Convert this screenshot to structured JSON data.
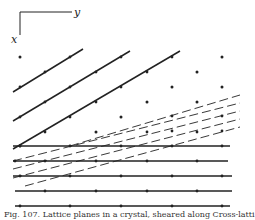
{
  "figure": {
    "axes": {
      "x_label": "x",
      "y_label": "y",
      "corner": [
        20,
        12
      ],
      "y_axis_end": [
        72,
        12
      ],
      "x_axis_end": [
        20,
        35
      ]
    },
    "colors": {
      "ink": "#222222",
      "background": "#ffffff"
    },
    "solid_diagonal_lines": [
      {
        "from": [
          13,
          92
        ],
        "to": [
          83,
          49
        ],
        "dots": [
          [
            20,
            87
          ],
          [
            45,
            72
          ],
          [
            70,
            57
          ]
        ]
      },
      {
        "from": [
          13,
          121
        ],
        "to": [
          130,
          51
        ],
        "dots": [
          [
            20,
            117
          ],
          [
            45,
            102
          ],
          [
            70,
            87
          ],
          [
            96,
            72
          ],
          [
            121,
            57
          ]
        ]
      },
      {
        "from": [
          13,
          149
        ],
        "to": [
          180,
          51
        ],
        "dots": [
          [
            20,
            146
          ],
          [
            45,
            132
          ],
          [
            70,
            117
          ],
          [
            96,
            102
          ],
          [
            121,
            87
          ],
          [
            147,
            72
          ],
          [
            172,
            57
          ]
        ]
      }
    ],
    "horizontal_lines": [
      {
        "y": 146,
        "from_x": 13,
        "to_x": 230,
        "dots": [
          20,
          70,
          121,
          172,
          222
        ]
      },
      {
        "y": 161,
        "from_x": 13,
        "to_x": 228,
        "dots": [
          15,
          45,
          96,
          147,
          197
        ]
      },
      {
        "y": 176,
        "from_x": 13,
        "to_x": 232,
        "dots": [
          20,
          70,
          121,
          172,
          222
        ]
      },
      {
        "y": 191,
        "from_x": 15,
        "to_x": 232,
        "dots": [
          45,
          96,
          147,
          197
        ]
      },
      {
        "y": 206,
        "from_x": 15,
        "to_x": 230,
        "dots": [
          20,
          70,
          121,
          172,
          222
        ]
      }
    ],
    "dashed_lines": [
      {
        "from": [
          70,
          146
        ],
        "to": [
          240,
          95
        ]
      },
      {
        "from": [
          13,
          161
        ],
        "to": [
          240,
          103
        ]
      },
      {
        "from": [
          13,
          169
        ],
        "to": [
          240,
          111
        ]
      },
      {
        "from": [
          13,
          178
        ],
        "to": [
          240,
          119
        ]
      },
      {
        "from": [
          25,
          186
        ],
        "to": [
          240,
          127
        ]
      }
    ],
    "dashed_line_dots": [
      [
        172,
        116
      ],
      [
        222,
        116
      ],
      [
        147,
        132
      ],
      [
        197,
        132
      ],
      [
        172,
        131
      ],
      [
        222,
        131
      ]
    ],
    "isolated_dots": [
      [
        20,
        57
      ],
      [
        222,
        57
      ],
      [
        197,
        72
      ],
      [
        172,
        87
      ],
      [
        222,
        87
      ],
      [
        147,
        102
      ],
      [
        197,
        102
      ],
      [
        121,
        117
      ],
      [
        96,
        132
      ]
    ],
    "caption": "Fig. 107. Lattice planes in a crystal, sheared along Cross-latti"
  }
}
